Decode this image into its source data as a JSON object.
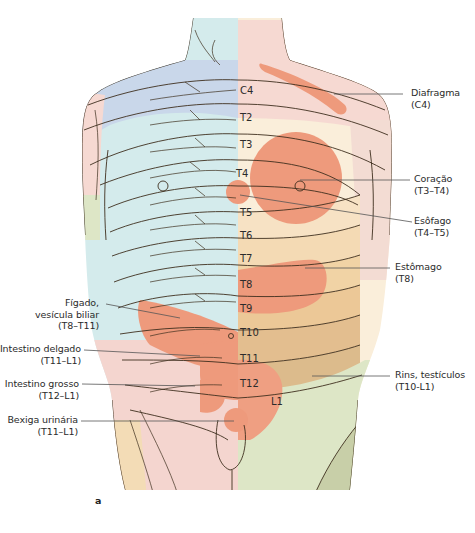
{
  "figure": {
    "panel_label": "a",
    "colors": {
      "dermatome_c4_blue": "#c9d7ea",
      "dermatome_light_cyan": "#d4ebec",
      "dermatome_pink": "#f6d9d2",
      "dermatome_cream": "#faeeda",
      "dermatome_tan": "#f1d3a5",
      "dermatome_brown": "#dcbb8c",
      "referred_pain_zone": "#ee9a7c",
      "dermatome_green": "#dde6c6",
      "dermatome_olive": "#c8cfa8",
      "nerve_line": "#3e2f1e"
    },
    "segments": [
      "C4",
      "T2",
      "T3",
      "T4",
      "T5",
      "T6",
      "T7",
      "T8",
      "T9",
      "T10",
      "T11",
      "T12",
      "L1"
    ],
    "labels_right": [
      {
        "organ": "Diafragma",
        "segments": "(C4)"
      },
      {
        "organ": "Coração",
        "segments": "(T3–T4)"
      },
      {
        "organ": "Esôfago",
        "segments": "(T4–T5)"
      },
      {
        "organ": "Estômago",
        "segments": "(T8)"
      },
      {
        "organ": "Rins, testículos",
        "segments": "(T10-L1)"
      }
    ],
    "labels_left": [
      {
        "organ": "Fígado,",
        "organ_line2": "vesícula biliar",
        "segments": "(T8–T11)"
      },
      {
        "organ": "Intestino delgado",
        "segments": "(T11–L1)"
      },
      {
        "organ": "Intestino grosso",
        "segments": "(T12–L1)"
      },
      {
        "organ": "Bexiga urinária",
        "segments": "(T11–L1)"
      }
    ]
  }
}
